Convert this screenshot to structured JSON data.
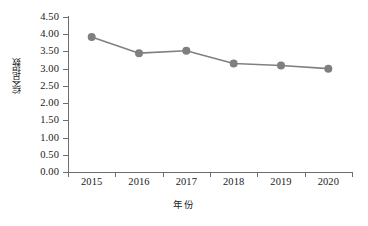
{
  "chart_data": {
    "type": "line",
    "title": "",
    "subtitle": "",
    "xlabel": "年份",
    "ylabel": "综合指数",
    "categories": [
      "2015",
      "2016",
      "2017",
      "2018",
      "2019",
      "2020"
    ],
    "x": [
      2015,
      2016,
      2017,
      2018,
      2019,
      2020
    ],
    "series": [
      {
        "name": "综合指数",
        "values": [
          3.92,
          3.45,
          3.52,
          3.15,
          3.09,
          3.0
        ],
        "color": "#808080",
        "marker": "circle",
        "marker_color": "#7f7f7f"
      }
    ],
    "ylim": [
      0.0,
      4.5
    ],
    "ytick_labels": [
      "0.00",
      "0.50",
      "1.00",
      "1.50",
      "2.00",
      "2.50",
      "3.00",
      "3.50",
      "4.00",
      "4.50"
    ],
    "ytick_values": [
      0.0,
      0.5,
      1.0,
      1.5,
      2.0,
      2.5,
      3.0,
      3.5,
      4.0,
      4.5
    ],
    "ytick_step": 0.5,
    "grid": false,
    "legend": false,
    "legend_position": "none",
    "axis_color": "#6d6d6d",
    "background": "#ffffff",
    "annotations": []
  },
  "axis": {
    "y_title": "综合指数",
    "x_title": "年份"
  },
  "labels": {
    "y": [
      "4.50",
      "4.00",
      "3.50",
      "3.00",
      "2.50",
      "2.00",
      "1.50",
      "1.00",
      "0.50",
      "0.00"
    ],
    "x": [
      "2015",
      "2016",
      "2017",
      "2018",
      "2019",
      "2020"
    ]
  }
}
